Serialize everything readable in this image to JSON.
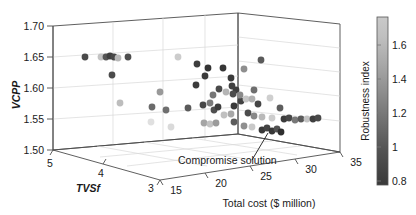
{
  "figure": {
    "type": "3d-scatter",
    "background": "#ffffff"
  },
  "axes": {
    "y": {
      "label": "VCPP",
      "ticks": [
        "1.70",
        "1.65",
        "1.60",
        "1.55",
        "1.50"
      ],
      "values": [
        1.7,
        1.65,
        1.6,
        1.55,
        1.5
      ],
      "range": [
        1.5,
        1.7
      ]
    },
    "depth": {
      "label": "TVSf",
      "ticks": [
        "5",
        "4",
        "3"
      ],
      "values": [
        5,
        4,
        3
      ],
      "range": [
        3,
        5
      ]
    },
    "x": {
      "label": "Total cost ($ million)",
      "ticks": [
        "15",
        "20",
        "25",
        "30",
        "35"
      ],
      "values": [
        15,
        20,
        25,
        30,
        35
      ],
      "range": [
        15,
        35
      ]
    }
  },
  "colorbar": {
    "title": "Robustness index",
    "ticks": [
      "1.6",
      "1.4",
      "1.2",
      "1",
      "0.8"
    ],
    "values": [
      1.6,
      1.4,
      1.2,
      1.0,
      0.8
    ],
    "range": [
      0.75,
      1.72
    ],
    "gradient_top": "#c9c9c9",
    "gradient_bottom": "#3a3a3a",
    "colormap": "gray"
  },
  "annotations": [
    {
      "text": "Compromise solution",
      "name": "compromise-solution-label"
    }
  ],
  "chart_data": {
    "type": "scatter",
    "title": "",
    "xlabel": "Total cost ($ million)",
    "ylabel": "VCPP",
    "zlabel": "TVSf",
    "clabel": "Robustness index",
    "xlim": [
      15,
      35
    ],
    "ylim": [
      1.5,
      1.7
    ],
    "zlim": [
      3,
      5
    ],
    "clim": [
      0.75,
      1.72
    ],
    "grid": true,
    "legend": "none",
    "point_fields": [
      "px",
      "py",
      "color"
    ],
    "points": [
      {
        "px": 85,
        "py": 57,
        "color": "#4a4a4a"
      },
      {
        "px": 101,
        "py": 57,
        "color": "#c3c3c3"
      },
      {
        "px": 106,
        "py": 57,
        "color": "#555555"
      },
      {
        "px": 110,
        "py": 56,
        "color": "#3f3f3f"
      },
      {
        "px": 114,
        "py": 57,
        "color": "#484848"
      },
      {
        "px": 118,
        "py": 58,
        "color": "#b8b8b8"
      },
      {
        "px": 128,
        "py": 57,
        "color": "#4e4e4e"
      },
      {
        "px": 178,
        "py": 57,
        "color": "#cccccc"
      },
      {
        "px": 112,
        "py": 75,
        "color": "#4b4b4b"
      },
      {
        "px": 208,
        "py": 68,
        "color": "#333333"
      },
      {
        "px": 223,
        "py": 68,
        "color": "#363636"
      },
      {
        "px": 244,
        "py": 69,
        "color": "#8e8e8e"
      },
      {
        "px": 261,
        "py": 60,
        "color": "#5a5a5a"
      },
      {
        "px": 254,
        "py": 90,
        "color": "#6e6e6e"
      },
      {
        "px": 160,
        "py": 92,
        "color": "#999999"
      },
      {
        "px": 196,
        "py": 85,
        "color": "#3c3c3c"
      },
      {
        "px": 205,
        "py": 76,
        "color": "#3a3a3a"
      },
      {
        "px": 213,
        "py": 95,
        "color": "#777777"
      },
      {
        "px": 219,
        "py": 89,
        "color": "#4a4a4a"
      },
      {
        "px": 226,
        "py": 92,
        "color": "#b5b5b5"
      },
      {
        "px": 236,
        "py": 90,
        "color": "#3e3e3e"
      },
      {
        "px": 241,
        "py": 101,
        "color": "#434343"
      },
      {
        "px": 120,
        "py": 103,
        "color": "#bdbdbd"
      },
      {
        "px": 152,
        "py": 107,
        "color": "#6b6b6b"
      },
      {
        "px": 166,
        "py": 110,
        "color": "#6f6f6f"
      },
      {
        "px": 188,
        "py": 108,
        "color": "#5b5b5b"
      },
      {
        "px": 203,
        "py": 105,
        "color": "#474747"
      },
      {
        "px": 210,
        "py": 103,
        "color": "#7b7b7b"
      },
      {
        "px": 214,
        "py": 110,
        "color": "#505050"
      },
      {
        "px": 218,
        "py": 107,
        "color": "#3d3d3d"
      },
      {
        "px": 224,
        "py": 115,
        "color": "#c0c0c0"
      },
      {
        "px": 231,
        "py": 114,
        "color": "#a8a8a8"
      },
      {
        "px": 234,
        "py": 106,
        "color": "#3b3b3b"
      },
      {
        "px": 240,
        "py": 95,
        "color": "#8a8a8a"
      },
      {
        "px": 246,
        "py": 99,
        "color": "#c7c7c7"
      },
      {
        "px": 252,
        "py": 99,
        "color": "#b0b0b0"
      },
      {
        "px": 258,
        "py": 104,
        "color": "#454545"
      },
      {
        "px": 270,
        "py": 98,
        "color": "#cfcfcf"
      },
      {
        "px": 280,
        "py": 108,
        "color": "#5e5e5e"
      },
      {
        "px": 248,
        "py": 113,
        "color": "#4c4c4c"
      },
      {
        "px": 254,
        "py": 116,
        "color": "#888888"
      },
      {
        "px": 262,
        "py": 117,
        "color": "#b9b9b9"
      },
      {
        "px": 272,
        "py": 118,
        "color": "#cdcdcd"
      },
      {
        "px": 284,
        "py": 119,
        "color": "#3c3c3c"
      },
      {
        "px": 289,
        "py": 118,
        "color": "#474747"
      },
      {
        "px": 295,
        "py": 120,
        "color": "#787878"
      },
      {
        "px": 301,
        "py": 119,
        "color": "#5a5a5a"
      },
      {
        "px": 307,
        "py": 119,
        "color": "#c4c4c4"
      },
      {
        "px": 313,
        "py": 119,
        "color": "#3f3f3f"
      },
      {
        "px": 318,
        "py": 118,
        "color": "#4a4a4a"
      },
      {
        "px": 204,
        "py": 123,
        "color": "#a5a5a5"
      },
      {
        "px": 210,
        "py": 124,
        "color": "#c2c2c2"
      },
      {
        "px": 216,
        "py": 123,
        "color": "#9b9b9b"
      },
      {
        "px": 234,
        "py": 122,
        "color": "#5c5c5c"
      },
      {
        "px": 244,
        "py": 126,
        "color": "#8f8f8f"
      },
      {
        "px": 252,
        "py": 127,
        "color": "#c9c9c9"
      },
      {
        "px": 262,
        "py": 130,
        "color": "#3a3a3a"
      },
      {
        "px": 267,
        "py": 128,
        "color": "#444444"
      },
      {
        "px": 272,
        "py": 131,
        "color": "#383838"
      },
      {
        "px": 277,
        "py": 129,
        "color": "#525252"
      },
      {
        "px": 281,
        "py": 132,
        "color": "#2f2f2f"
      },
      {
        "px": 231,
        "py": 78,
        "color": "#3a3a3a"
      },
      {
        "px": 232,
        "py": 86,
        "color": "#414141"
      },
      {
        "px": 233,
        "py": 94,
        "color": "#4d4d4d"
      },
      {
        "px": 197,
        "py": 64,
        "color": "#3e3e3e"
      },
      {
        "px": 151,
        "py": 122,
        "color": "#e0e0e0"
      },
      {
        "px": 171,
        "py": 127,
        "color": "#dadada"
      }
    ]
  }
}
